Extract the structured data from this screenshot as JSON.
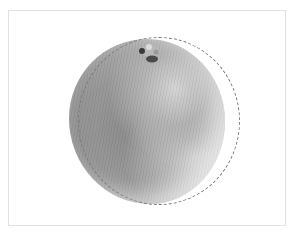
{
  "image": {
    "subject": "orange",
    "style": "grayscale photograph",
    "overlay": "dashed elliptical selection outline",
    "colors": {
      "background": "#ffffff",
      "frame_border": "#e2e2e2",
      "selection_outline": "#7a7a7a",
      "fruit_dark": "#8c8c8c",
      "fruit_light": "#d8d8d8"
    }
  }
}
